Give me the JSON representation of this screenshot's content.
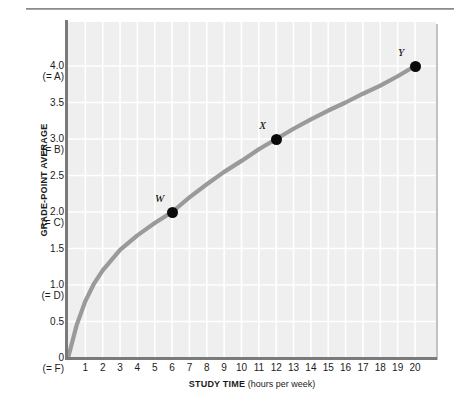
{
  "chart_data": {
    "type": "line",
    "title": "",
    "xlabel_bold": "STUDY TIME",
    "xlabel_normal": " (hours per week)",
    "ylabel": "GRADE-POINT AVERAGE",
    "xlim": [
      0,
      20.5
    ],
    "ylim": [
      0,
      4.3
    ],
    "grid": true,
    "legend": "none",
    "curve_color": "#9a9a9a",
    "plot_bg": "#efefef",
    "gridline_color": "#ffffff",
    "axis_color": "#7a7a7a",
    "x_ticks": [
      "1",
      "2",
      "3",
      "4",
      "5",
      "6",
      "7",
      "8",
      "9",
      "10",
      "11",
      "12",
      "13",
      "14",
      "15",
      "16",
      "17",
      "18",
      "19",
      "20"
    ],
    "x_tick_values": [
      1,
      2,
      3,
      4,
      5,
      6,
      7,
      8,
      9,
      10,
      11,
      12,
      13,
      14,
      15,
      16,
      17,
      18,
      19,
      20
    ],
    "y_ticks": [
      {
        "value": 4.0,
        "label": "4.0",
        "sub": "(= A)"
      },
      {
        "value": 3.5,
        "label": "3.5",
        "sub": ""
      },
      {
        "value": 3.0,
        "label": "3.0",
        "sub": "(= B)"
      },
      {
        "value": 2.5,
        "label": "2.5",
        "sub": ""
      },
      {
        "value": 2.0,
        "label": "2.0",
        "sub": "(= C)"
      },
      {
        "value": 1.5,
        "label": "1.5",
        "sub": ""
      },
      {
        "value": 1.0,
        "label": "1.0",
        "sub": "(= D)"
      },
      {
        "value": 0.5,
        "label": "0.5",
        "sub": ""
      },
      {
        "value": 0.0,
        "label": "0",
        "sub": "(= F)"
      }
    ],
    "series": [
      {
        "name": "GPA vs study time",
        "x": [
          0,
          0.5,
          1,
          1.5,
          2,
          3,
          4,
          5,
          6,
          7,
          8,
          9,
          10,
          11,
          12,
          13,
          14,
          15,
          16,
          17,
          18,
          19,
          20
        ],
        "y": [
          0,
          0.45,
          0.78,
          1.02,
          1.2,
          1.48,
          1.68,
          1.85,
          2.0,
          2.2,
          2.38,
          2.55,
          2.7,
          2.86,
          3.0,
          3.14,
          3.27,
          3.39,
          3.5,
          3.62,
          3.73,
          3.86,
          4.0
        ]
      }
    ],
    "annotated_points": [
      {
        "label": "W",
        "x": 6,
        "y": 2.0
      },
      {
        "label": "X",
        "x": 12,
        "y": 3.0
      },
      {
        "label": "Y",
        "x": 20,
        "y": 4.0
      }
    ]
  }
}
